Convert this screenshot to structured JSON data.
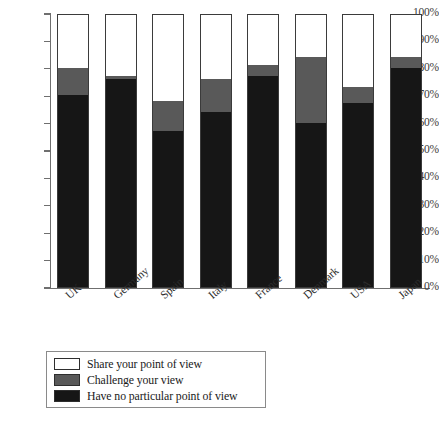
{
  "chart_data": {
    "type": "bar",
    "stacked": true,
    "title": "",
    "subtitle": "",
    "xlabel": "",
    "ylabel": "",
    "ylim": [
      0,
      100
    ],
    "y_unit": "%",
    "grid": false,
    "legend_position": "bottom-left",
    "categories": [
      "UK",
      "Germany",
      "Spain",
      "Italy",
      "France",
      "Denmark",
      "USA",
      "Japan"
    ],
    "y_ticks": [
      "0%",
      "10%",
      "20%",
      "30%",
      "40%",
      "50%",
      "60%",
      "70%",
      "80%",
      "90%",
      "100%"
    ],
    "y_tick_values": [
      0,
      10,
      20,
      30,
      40,
      50,
      60,
      70,
      80,
      90,
      100
    ],
    "series": [
      {
        "name": "Have no particular point of view",
        "color": "#161616",
        "values": [
          70,
          76,
          57,
          64,
          77,
          60,
          67,
          80
        ]
      },
      {
        "name": "Challenge your view",
        "color": "#595959",
        "values": [
          10,
          1,
          11,
          12,
          4,
          24,
          6,
          4
        ]
      },
      {
        "name": "Share your point of view",
        "color": "#ffffff",
        "values": [
          20,
          23,
          32,
          24,
          19,
          16,
          27,
          16
        ]
      }
    ],
    "legend": [
      {
        "label": "Share your point of view",
        "color": "#ffffff"
      },
      {
        "label": "Challenge your view",
        "color": "#595959"
      },
      {
        "label": "Have no particular point of view",
        "color": "#161616"
      }
    ]
  }
}
